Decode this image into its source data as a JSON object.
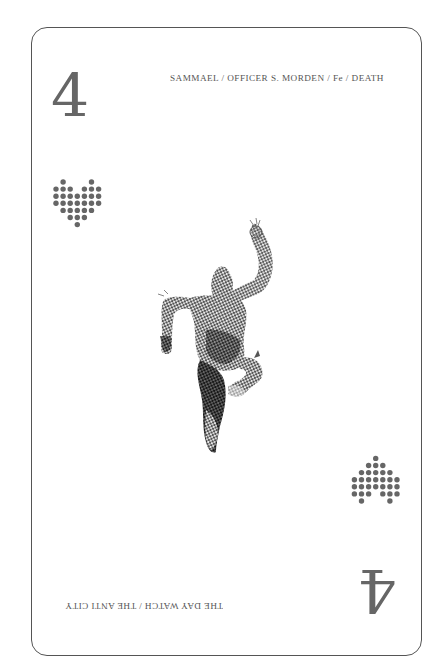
{
  "card": {
    "rank": "4",
    "suit": "heart",
    "suit_icon": "dotted-heart-icon",
    "caption_top": "SAMMAEL / OFFICER S. MORDEN / Fe / DEATH",
    "caption_bottom": "THE DAY WATCH / THE ANTI CITY",
    "figure_icon": "halftone-leaping-figure-illustration",
    "colors": {
      "border": "#555555",
      "rank": "#666666",
      "pip": "#666666",
      "caption": "#555555",
      "figure": "#3a3a3a",
      "background": "#ffffff"
    },
    "pip_pattern": [
      ".X...X.",
      "XXX.XXX",
      "XXXXXXX",
      "XXXXXXX",
      ".XXXXX.",
      "..XXX..",
      "...X..."
    ]
  }
}
